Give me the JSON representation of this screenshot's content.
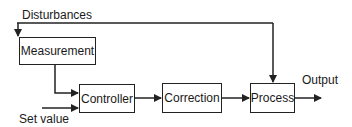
{
  "diagram": {
    "type": "block-diagram",
    "title": "",
    "labels": {
      "disturbances": "Disturbances",
      "set_value": "Set value",
      "output": "Output"
    },
    "blocks": [
      {
        "id": "measurement",
        "label": "Measurement"
      },
      {
        "id": "controller",
        "label": "Controller"
      },
      {
        "id": "correction",
        "label": "Correction"
      },
      {
        "id": "process",
        "label": "Process"
      }
    ],
    "connections": [
      {
        "from": "disturbances",
        "to": "measurement"
      },
      {
        "from": "disturbances",
        "to": "process"
      },
      {
        "from": "measurement",
        "to": "controller"
      },
      {
        "from": "set_value",
        "to": "controller"
      },
      {
        "from": "controller",
        "to": "correction"
      },
      {
        "from": "correction",
        "to": "process"
      },
      {
        "from": "process",
        "to": "output"
      }
    ],
    "colors": {
      "line": "#222222",
      "background": "#ffffff"
    }
  }
}
